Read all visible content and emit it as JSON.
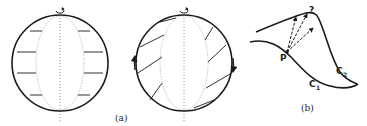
{
  "figure": {
    "panel_a": {
      "label": "(a)",
      "left_sphere": {
        "description": "sphere with rigid rotation, horizontal flow lines",
        "rotation_icon": "rotation-arrow-icon"
      },
      "right_sphere": {
        "description": "sphere with sheared flow, slanted lines with side arrows",
        "rotation_icon": "rotation-arrow-icon"
      }
    },
    "panel_b": {
      "label": "(b)",
      "point_label": "P",
      "question_label": "?",
      "curve1_label": "C",
      "curve1_sub": "1",
      "curve2_label": "C",
      "curve2_sub": "2"
    },
    "colors": {
      "stroke": "#1a1a1a",
      "dotted": "#777777",
      "background": "#ffffff"
    }
  }
}
